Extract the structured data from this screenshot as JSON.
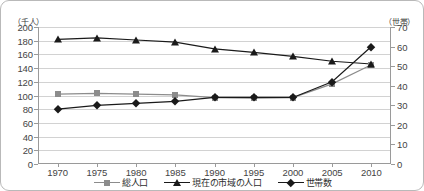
{
  "axes": {
    "left_unit": "（千人）",
    "right_unit": "（世帯）",
    "left_ticks": [
      "200",
      "180",
      "160",
      "140",
      "120",
      "100",
      "80",
      "60",
      "40",
      "20",
      "0"
    ],
    "right_ticks": [
      "70",
      "60",
      "50",
      "40",
      "30",
      "20",
      "10",
      "0"
    ],
    "x_ticks": [
      "1970",
      "1975",
      "1980",
      "1985",
      "1990",
      "1995",
      "2000",
      "2005",
      "2010"
    ]
  },
  "legend": {
    "items": [
      {
        "label": "総人口",
        "marker": "square-marker",
        "color": "#8c8c8c"
      },
      {
        "label": "現在の市域の人口",
        "marker": "triangle-marker",
        "color": "#1a1a1a"
      },
      {
        "label": "世帯数",
        "marker": "diamond-marker",
        "color": "#1a1a1a"
      }
    ]
  },
  "chart_data": {
    "type": "line",
    "title": "",
    "xlabel": "",
    "ylabel": "（千人）",
    "y2label": "（世帯）",
    "grid": true,
    "legend_position": "bottom",
    "x": [
      1970,
      1975,
      1980,
      1985,
      1990,
      1995,
      2000,
      2005,
      2010
    ],
    "categories": [
      "1970",
      "1975",
      "1980",
      "1985",
      "1990",
      "1995",
      "2000",
      "2005",
      "2010"
    ],
    "ylim": [
      0,
      200
    ],
    "y2lim": [
      0,
      70
    ],
    "ytick_step": 20,
    "y2tick_step": 10,
    "series": [
      {
        "name": "総人口",
        "axis": "left",
        "marker": "square",
        "color": "#8c8c8c",
        "values": [
          102,
          103,
          102,
          101,
          97,
          96,
          97,
          117,
          145
        ]
      },
      {
        "name": "現在の市域の人口",
        "axis": "left",
        "marker": "triangle",
        "color": "#1a1a1a",
        "values": [
          182,
          184,
          181,
          178,
          168,
          163,
          157,
          150,
          146
        ]
      },
      {
        "name": "世帯数",
        "axis": "right",
        "marker": "diamond",
        "color": "#1a1a1a",
        "values": [
          28,
          30,
          31,
          32,
          34,
          34,
          34,
          42,
          60
        ]
      }
    ]
  }
}
